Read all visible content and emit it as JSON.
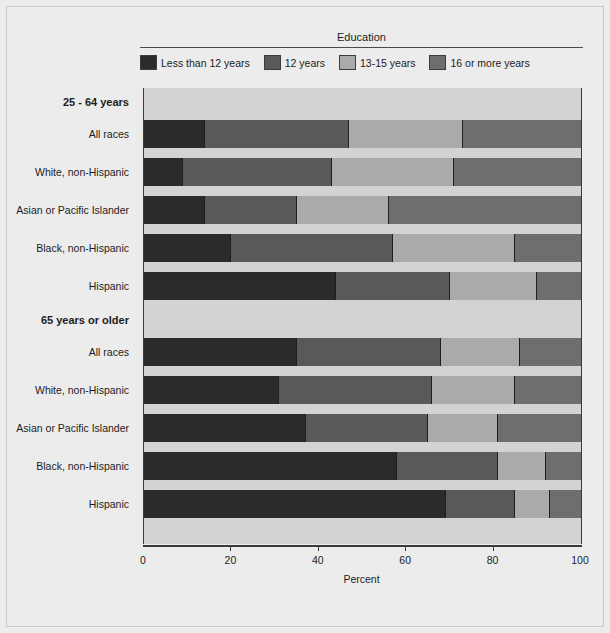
{
  "legend": {
    "title": "Education",
    "items": [
      {
        "label": "Less than 12 years",
        "color": "#2b2b2b"
      },
      {
        "label": "12 years",
        "color": "#595959"
      },
      {
        "label": "13-15 years",
        "color": "#aaaaaa"
      },
      {
        "label": "16 or more years",
        "color": "#6e6e6e"
      }
    ]
  },
  "axis": {
    "xlabel": "Percent",
    "ticks": [
      "0",
      "20",
      "40",
      "60",
      "80",
      "100"
    ]
  },
  "groups": [
    {
      "header": "25 - 64 years",
      "rows": [
        {
          "label": "All races"
        },
        {
          "label": "White, non-Hispanic"
        },
        {
          "label": "Asian or Pacific Islander"
        },
        {
          "label": "Black, non-Hispanic"
        },
        {
          "label": "Hispanic"
        }
      ]
    },
    {
      "header": "65 years or older",
      "rows": [
        {
          "label": "All races"
        },
        {
          "label": "White, non-Hispanic"
        },
        {
          "label": "Asian or Pacific Islander"
        },
        {
          "label": "Black, non-Hispanic"
        },
        {
          "label": "Hispanic"
        }
      ]
    }
  ],
  "chart_data": {
    "type": "bar",
    "orientation": "horizontal",
    "stacked": true,
    "title": "",
    "xlabel": "Percent",
    "ylabel": "",
    "xlim": [
      0,
      100
    ],
    "xticks": [
      0,
      20,
      40,
      60,
      80,
      100
    ],
    "grid": false,
    "legend_title": "Education",
    "legend_position": "top",
    "series": [
      {
        "name": "Less than 12 years",
        "color": "#2b2b2b",
        "values": [
          14,
          9,
          14,
          20,
          44,
          35,
          31,
          37,
          58,
          69
        ]
      },
      {
        "name": "12 years",
        "color": "#595959",
        "values": [
          33,
          34,
          21,
          37,
          26,
          33,
          35,
          28,
          23,
          16
        ]
      },
      {
        "name": "13-15 years",
        "color": "#aaaaaa",
        "values": [
          26,
          28,
          21,
          28,
          20,
          18,
          19,
          16,
          11,
          8
        ]
      },
      {
        "name": "16 or more years",
        "color": "#6e6e6e",
        "values": [
          27,
          29,
          44,
          15,
          10,
          14,
          15,
          19,
          8,
          7
        ]
      }
    ],
    "categories": [
      "25-64 years: All races",
      "25-64 years: White, non-Hispanic",
      "25-64 years: Asian or Pacific Islander",
      "25-64 years: Black, non-Hispanic",
      "25-64 years: Hispanic",
      "65 years or older: All races",
      "65 years or older: White, non-Hispanic",
      "65 years or older: Asian or Pacific Islander",
      "65 years or older: Black, non-Hispanic",
      "65 years or older: Hispanic"
    ]
  }
}
